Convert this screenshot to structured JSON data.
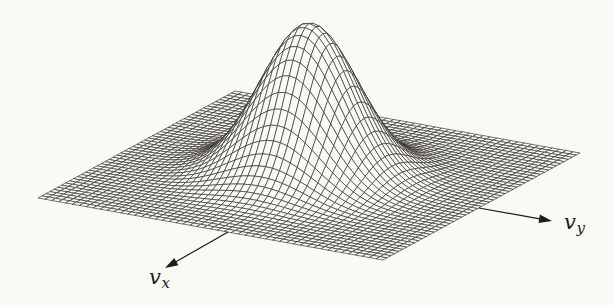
{
  "figure": {
    "background_color": "#fafaf5",
    "mesh_line_color": "#2e2c29",
    "annotation_color": "#1e1c1a",
    "width_px": 614,
    "height_px": 305
  },
  "chart_data": {
    "type": "surface",
    "subtype": "3d-wireframe-mesh-hidden-lines-removed",
    "surface_function": "f(vx,vy) = A * exp(-(vx^2 + vy^2) / (2 * sigma^2))",
    "sigma": 0.25,
    "amplitude_px": 152,
    "domain_u": [
      -1,
      1
    ],
    "domain_v": [
      -1,
      1
    ],
    "grid_divisions": 50,
    "projection": {
      "left_corner": [
        38,
        198
      ],
      "front_corner": [
        383,
        260
      ],
      "right_corner": [
        580,
        153
      ],
      "back_corner": [
        235,
        91
      ]
    },
    "axes": [
      {
        "id": "vx",
        "label_base": "v",
        "label_sub": "x",
        "arrow_tail": [
          228,
          232
        ],
        "arrow_head": [
          165,
          268
        ],
        "label_x": 149,
        "label_y": 284
      },
      {
        "id": "vy",
        "label_base": "v",
        "label_sub": "y",
        "arrow_tail": [
          479,
          208
        ],
        "arrow_head": [
          552,
          221
        ],
        "label_x": 564,
        "label_y": 229
      }
    ]
  }
}
